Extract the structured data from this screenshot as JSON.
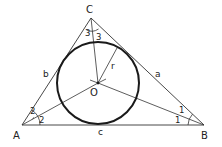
{
  "diagram": {
    "colors": {
      "line": "#333333",
      "circle": "#1a1a1a",
      "background": "#ffffff"
    },
    "vertices": {
      "A": {
        "label": "A",
        "x": 22,
        "y": 125
      },
      "B": {
        "label": "B",
        "x": 204,
        "y": 125
      },
      "C": {
        "label": "C",
        "x": 91,
        "y": 18
      }
    },
    "incenter": {
      "label": "O",
      "x": 98,
      "y": 83
    },
    "incircle": {
      "radius": 41,
      "radius_label": "r"
    },
    "sides": {
      "a": "a",
      "b": "b",
      "c": "c"
    },
    "angle_labels": {
      "A_upper": "2",
      "A_lower": "2",
      "B_upper": "1",
      "B_lower": "1",
      "C_left": "3",
      "C_right": "3"
    }
  }
}
